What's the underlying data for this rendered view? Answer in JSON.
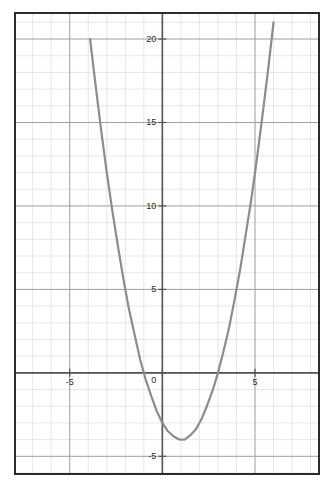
{
  "chart_data": {
    "type": "line",
    "title": "",
    "subtitle": "",
    "xlabel": "",
    "ylabel": "",
    "xlim": [
      -7.9,
      8.4
    ],
    "ylim": [
      -6.0,
      21.5
    ],
    "grid": true,
    "minor_grid": true,
    "major_grid_step": 5,
    "minor_grid_step": 1,
    "legend": "none",
    "axes": {
      "x_axis_value": 0,
      "y_axis_value": 0,
      "x_ticks": [
        -5,
        0,
        5
      ],
      "x_tick_labels": [
        "-5",
        "0",
        "5"
      ],
      "y_ticks": [
        -5,
        0,
        5,
        10,
        15,
        20
      ],
      "y_tick_labels": [
        "-5",
        "0",
        "5",
        "10",
        "15",
        "20"
      ],
      "zero_label_shared": "0"
    },
    "series": [
      {
        "name": "parabola",
        "equation": "y = x^2 - 2x - 3",
        "color": "#8c8c8c",
        "line_width": 2.2,
        "vertex": [
          1,
          -4
        ],
        "roots": [
          -1,
          3
        ],
        "y_intercept": -3,
        "x": [
          -3.9,
          -3.6,
          -3.3,
          -3.0,
          -2.7,
          -2.4,
          -2.1,
          -1.8,
          -1.5,
          -1.2,
          -0.9,
          -0.6,
          -0.3,
          0.0,
          0.3,
          0.6,
          0.9,
          1.2,
          1.5,
          1.8,
          2.1,
          2.4,
          2.7,
          3.0,
          3.3,
          3.6,
          3.9,
          4.2,
          4.5,
          4.8,
          5.1,
          5.4,
          5.7,
          6.0
        ],
        "y": [
          20.0,
          17.2,
          14.5,
          12.0,
          9.7,
          7.6,
          5.6,
          3.8,
          2.3,
          0.8,
          -0.4,
          -1.4,
          -2.3,
          -3.0,
          -3.5,
          -3.8,
          -3.99,
          -4.0,
          -3.75,
          -3.4,
          -2.8,
          -2.0,
          -1.1,
          0.0,
          1.3,
          2.7,
          4.4,
          6.2,
          8.3,
          10.4,
          12.8,
          15.4,
          18.1,
          21.0
        ]
      }
    ],
    "colors": {
      "curve": "#8c8c8c",
      "axis": "#555555",
      "major_grid": "#9aa0a6",
      "minor_grid": "#d9dde3",
      "border": "#2b2b2b",
      "background": "#ffffff",
      "text": "#2b2b2b"
    }
  },
  "labels": {
    "y_20": "20",
    "y_15": "15",
    "y_10": "10",
    "y_5": "5",
    "origin": "0",
    "y_neg5": "-5",
    "x_neg5": "-5",
    "x_5": "5"
  }
}
